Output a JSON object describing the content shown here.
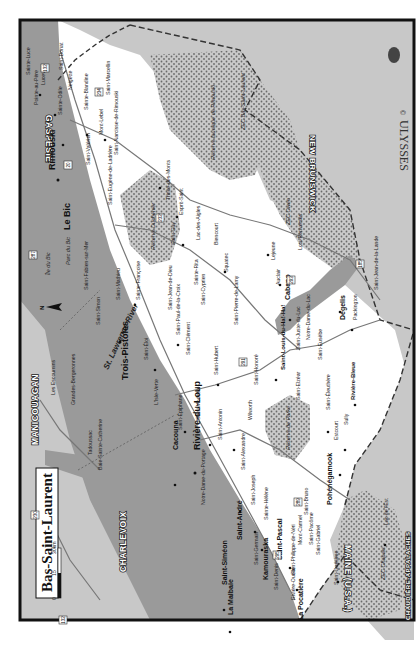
{
  "map": {
    "title": "Bas-Saint-Laurent",
    "publisher": "ULYSSES",
    "copyright_symbol": "©",
    "orientation": "rotated 90° counter-clockwise",
    "scale_bar": {
      "ticks": [
        "0",
        "15",
        "30km"
      ]
    },
    "north_arrow_label": "N",
    "colors": {
      "water": "#9a9a9a",
      "land": "#ffffff",
      "other_region": "#c8c8c8",
      "reserve": "#bdbdbd",
      "frame": "#111111"
    },
    "regions": [
      {
        "name": "GASPÉSIE"
      },
      {
        "name": "NEW BRUNSWICK"
      },
      {
        "name": "MAINE (U.S.A.)"
      },
      {
        "name": "CHAUDIÈRE-APPALACHES"
      },
      {
        "name": "CHARLEVOIX"
      },
      {
        "name": "MANICOUAGAN"
      }
    ],
    "reserves": [
      {
        "name": "Réserve faunique de Rimouski"
      },
      {
        "name": "Réserve Duchénier"
      },
      {
        "name": "ZEC Owen"
      },
      {
        "name": "ZEC Bas-Saint-Laurent"
      },
      {
        "name": "Réserve de Parke"
      },
      {
        "name": "ZEC Chapais"
      },
      {
        "name": "Parc du Bic"
      }
    ],
    "water_labels": [
      {
        "name": "St. Lawrence River"
      },
      {
        "name": "Île du Bic"
      },
      {
        "name": "Île aux Basques"
      },
      {
        "name": "Île Verte"
      },
      {
        "name": "Îles Pèlerins"
      },
      {
        "name": "Baie-Sainte-Catherine"
      },
      {
        "name": "Lac Témiscouata"
      },
      {
        "name": "Rimouski-Forestville"
      },
      {
        "name": "Rivière-du-Loup–Saint-Siméon"
      },
      {
        "name": "Rivière-du-Loup"
      }
    ],
    "ferries": [
      {
        "name": "Rivière-du-Loup–Saint-Siméon"
      },
      {
        "name": "Trois-Pistoles–Les Escoumins"
      },
      {
        "name": "Rimouski–Forestville"
      },
      {
        "name": "Baie-Sainte-Catherine–Tadoussac Traversier"
      }
    ],
    "route_shields": [
      "132",
      "20",
      "234",
      "232",
      "185",
      "291",
      "293",
      "295",
      "289",
      "287",
      "230",
      "138",
      "172",
      "362"
    ],
    "cities_major": [
      {
        "name": "Rimouski"
      },
      {
        "name": "Le Bic"
      },
      {
        "name": "Trois-Pistoles"
      },
      {
        "name": "Rivière-du-Loup"
      },
      {
        "name": "Cacouna"
      },
      {
        "name": "Saint-André"
      },
      {
        "name": "Kamouraska"
      },
      {
        "name": "Saint-Pascal"
      },
      {
        "name": "La Pocatière"
      },
      {
        "name": "Saint-Siméon"
      },
      {
        "name": "La Malbaie"
      },
      {
        "name": "Dégelis"
      },
      {
        "name": "Cabano"
      },
      {
        "name": "Saint-Louis-du-Ha!-Ha!"
      },
      {
        "name": "Pohénégamook"
      },
      {
        "name": "Rivière-Bleue"
      },
      {
        "name": "Sainte-Luce"
      },
      {
        "name": "Pointe-au-Père"
      }
    ],
    "towns": [
      {
        "name": "Luceville"
      },
      {
        "name": "Saint-Donat"
      },
      {
        "name": "Sainte-Odile"
      },
      {
        "name": "Neigette"
      },
      {
        "name": "Sainte-Blandine"
      },
      {
        "name": "Saint-Marcellin"
      },
      {
        "name": "Mont-Lebel"
      },
      {
        "name": "Saint-Valérien"
      },
      {
        "name": "Saint-Narcisse-de-Rimouski"
      },
      {
        "name": "Saint-Fabien-sur-Mer"
      },
      {
        "name": "Saint-Eugène-de-Ladrière"
      },
      {
        "name": "Saint-Simon"
      },
      {
        "name": "Saint-Mathieu"
      },
      {
        "name": "Trinité-des-Monts"
      },
      {
        "name": "Esprit-Saint"
      },
      {
        "name": "Saint-Guy"
      },
      {
        "name": "Lac-des-Aigles"
      },
      {
        "name": "Biencourt"
      },
      {
        "name": "Squatec"
      },
      {
        "name": "Lejeune"
      },
      {
        "name": "Auclair"
      },
      {
        "name": "Lots-Renversés"
      },
      {
        "name": "Packington"
      },
      {
        "name": "Saint-Jean-de-la-Lande"
      },
      {
        "name": "Saint-Eusèbe"
      },
      {
        "name": "Notre-Dame-du-Lac"
      },
      {
        "name": "Saint-Juste-du-Lac"
      },
      {
        "name": "Sainte-Françoise"
      },
      {
        "name": "Sainte-Rita"
      },
      {
        "name": "Saint-Cyprien"
      },
      {
        "name": "Saint-Jean-de-Dieu"
      },
      {
        "name": "Saint-Paul-de-la-Croix"
      },
      {
        "name": "Saint-Éloi"
      },
      {
        "name": "Saint-Clément"
      },
      {
        "name": "Saint-Pierre-de-Lamy"
      },
      {
        "name": "Saint-Hubert"
      },
      {
        "name": "Saint-Honoré"
      },
      {
        "name": "Saint-Elzéar"
      },
      {
        "name": "Saint-Éleuthère"
      },
      {
        "name": "Estcourt"
      },
      {
        "name": "Sully"
      },
      {
        "name": "Saint-Épiphane"
      },
      {
        "name": "Saint-Modeste"
      },
      {
        "name": "Saint-Antonin"
      },
      {
        "name": "Wilworth"
      },
      {
        "name": "Saint-Alexandre"
      },
      {
        "name": "Notre-Dame-du-Portage"
      },
      {
        "name": "Saint-Joseph"
      },
      {
        "name": "Sainte-Hélène"
      },
      {
        "name": "Saint-Germain"
      },
      {
        "name": "Saint-Denis"
      },
      {
        "name": "Saint-Philippe-de-Néri"
      },
      {
        "name": "Mont-Carmel"
      },
      {
        "name": "Saint-Bruno"
      },
      {
        "name": "Saint-Pacôme"
      },
      {
        "name": "Saint-Gabriel"
      },
      {
        "name": "Saint-Onésime"
      },
      {
        "name": "Rivière-Ouelle"
      },
      {
        "name": "Lac de l'Est"
      },
      {
        "name": "L'Isle-Verte"
      },
      {
        "name": "Les Escoumins"
      },
      {
        "name": "Grandes-Bergeronnes"
      },
      {
        "name": "Tadoussac"
      },
      {
        "name": "Baie-Sainte-Catherine"
      },
      {
        "name": "Saint-Fabien"
      }
    ]
  }
}
